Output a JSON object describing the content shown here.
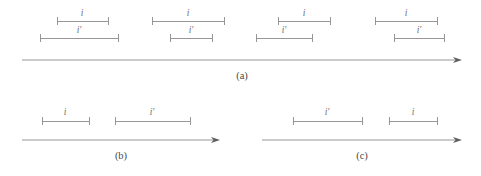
{
  "figure": {
    "label_i": "i",
    "label_i_prime": "i′",
    "stroke_color": "#8c8c8c",
    "label_color": "#6d6d6d",
    "caption_color": "#4a4a4a",
    "background": "#ffffff"
  },
  "panels": [
    {
      "id": "a",
      "caption": "(a)",
      "caption_x": 242,
      "caption_y": 79,
      "axis": {
        "x1": 22,
        "x2": 462,
        "y": 60
      },
      "groups": [
        {
          "name": "overlap-group-1",
          "top": {
            "label": "i",
            "x1": 57,
            "x2": 108,
            "y": 21,
            "label_x": 82,
            "label_y": 16
          },
          "bottom": {
            "label": "i′",
            "x1": 40,
            "x2": 118,
            "y": 38,
            "label_x": 79,
            "label_y": 33
          }
        },
        {
          "name": "overlap-group-2",
          "top": {
            "label": "i",
            "x1": 152,
            "x2": 224,
            "y": 21,
            "label_x": 188,
            "label_y": 16
          },
          "bottom": {
            "label": "i′",
            "x1": 170,
            "x2": 212,
            "y": 38,
            "label_x": 191,
            "label_y": 33
          }
        },
        {
          "name": "overlap-group-3",
          "top": {
            "label": "i",
            "x1": 278,
            "x2": 330,
            "y": 21,
            "label_x": 304,
            "label_y": 16
          },
          "bottom": {
            "label": "i′",
            "x1": 256,
            "x2": 312,
            "y": 38,
            "label_x": 284,
            "label_y": 33
          }
        },
        {
          "name": "overlap-group-4",
          "top": {
            "label": "i",
            "x1": 375,
            "x2": 437,
            "y": 21,
            "label_x": 406,
            "label_y": 16
          },
          "bottom": {
            "label": "i′",
            "x1": 394,
            "x2": 444,
            "y": 38,
            "label_x": 419,
            "label_y": 33
          }
        }
      ]
    },
    {
      "id": "b",
      "caption": "(b)",
      "caption_x": 121,
      "caption_y": 159,
      "axis": {
        "x1": 22,
        "x2": 220,
        "y": 140
      },
      "groups": [
        {
          "name": "before-group",
          "top": {
            "label": "i",
            "x1": 42,
            "x2": 89,
            "y": 121,
            "label_x": 65,
            "label_y": 115
          },
          "bottom": null
        },
        {
          "name": "after-group",
          "top": {
            "label": "i′",
            "x1": 115,
            "x2": 190,
            "y": 121,
            "label_x": 152,
            "label_y": 115
          },
          "bottom": null
        }
      ]
    },
    {
      "id": "c",
      "caption": "(c)",
      "caption_x": 362,
      "caption_y": 159,
      "axis": {
        "x1": 262,
        "x2": 462,
        "y": 140
      },
      "groups": [
        {
          "name": "before-group",
          "top": {
            "label": "i′",
            "x1": 293,
            "x2": 362,
            "y": 121,
            "label_x": 327,
            "label_y": 115
          },
          "bottom": null
        },
        {
          "name": "after-group",
          "top": {
            "label": "i",
            "x1": 389,
            "x2": 437,
            "y": 121,
            "label_x": 413,
            "label_y": 115
          },
          "bottom": null
        }
      ]
    }
  ]
}
